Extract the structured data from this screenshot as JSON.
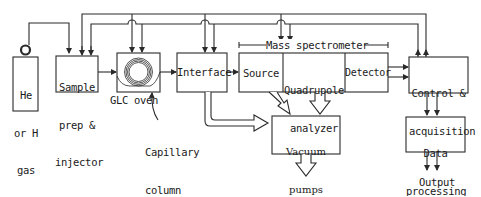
{
  "diagram": {
    "type": "block-diagram",
    "blocks": {
      "gas": {
        "line1": "He",
        "line2": "or H",
        "line3": "gas"
      },
      "sample_prep": {
        "line1": "Sample",
        "line2": "prep &",
        "line3": "injector"
      },
      "glc_oven": {
        "label": "GLC oven"
      },
      "interface": {
        "label": "Interface"
      },
      "mass_spectrometer": {
        "label": "Mass spectrometer"
      },
      "source": {
        "label": "Source"
      },
      "quadrupole": {
        "line1": "Quadrupole",
        "line2": "analyzer"
      },
      "detector": {
        "label": "Detector"
      },
      "control": {
        "line1": "Control &",
        "line2": "acquisition"
      },
      "data_processing": {
        "line1": "Data",
        "line2": "processing"
      },
      "vacuum_pumps": {
        "line1": "Vacuum",
        "line2": "pumps"
      }
    },
    "annotations": {
      "capillary_column": {
        "line1": "Capillary",
        "line2": "column"
      },
      "output": {
        "label": "Output"
      }
    },
    "colors": {
      "stroke": "#2a2a2a",
      "fill": "#ffffff",
      "text": "#1a1a1a"
    }
  }
}
